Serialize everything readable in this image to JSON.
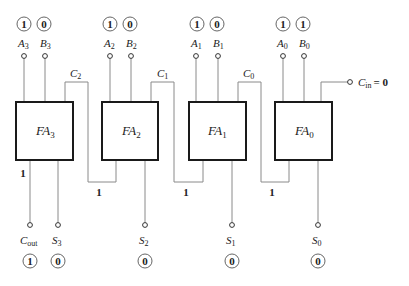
{
  "diagram": {
    "adders": [
      {
        "name": "FA",
        "index": "3",
        "a_label": "A",
        "a_sub": "3",
        "a_value": "1",
        "b_label": "B",
        "b_sub": "3",
        "b_value": "0",
        "s_label": "S",
        "s_sub": "3",
        "s_value": "0"
      },
      {
        "name": "FA",
        "index": "2",
        "a_label": "A",
        "a_sub": "2",
        "a_value": "1",
        "b_label": "B",
        "b_sub": "2",
        "b_value": "0",
        "s_label": "S",
        "s_sub": "2",
        "s_value": "0"
      },
      {
        "name": "FA",
        "index": "1",
        "a_label": "A",
        "a_sub": "1",
        "a_value": "1",
        "b_label": "B",
        "b_sub": "1",
        "b_value": "0",
        "s_label": "S",
        "s_sub": "1",
        "s_value": "0"
      },
      {
        "name": "FA",
        "index": "0",
        "a_label": "A",
        "a_sub": "0",
        "a_value": "1",
        "b_label": "B",
        "b_sub": "0",
        "b_value": "1",
        "s_label": "S",
        "s_sub": "0",
        "s_value": "0"
      }
    ],
    "carries": [
      {
        "label": "C",
        "sub": "2",
        "value": "1"
      },
      {
        "label": "C",
        "sub": "1",
        "value": "1"
      },
      {
        "label": "C",
        "sub": "0",
        "value": "1"
      }
    ],
    "cin": {
      "label": "C",
      "sub": "in",
      "value_text": "= 0"
    },
    "cout": {
      "label": "C",
      "sub": "out",
      "value": "1",
      "wire_value": "1"
    }
  }
}
